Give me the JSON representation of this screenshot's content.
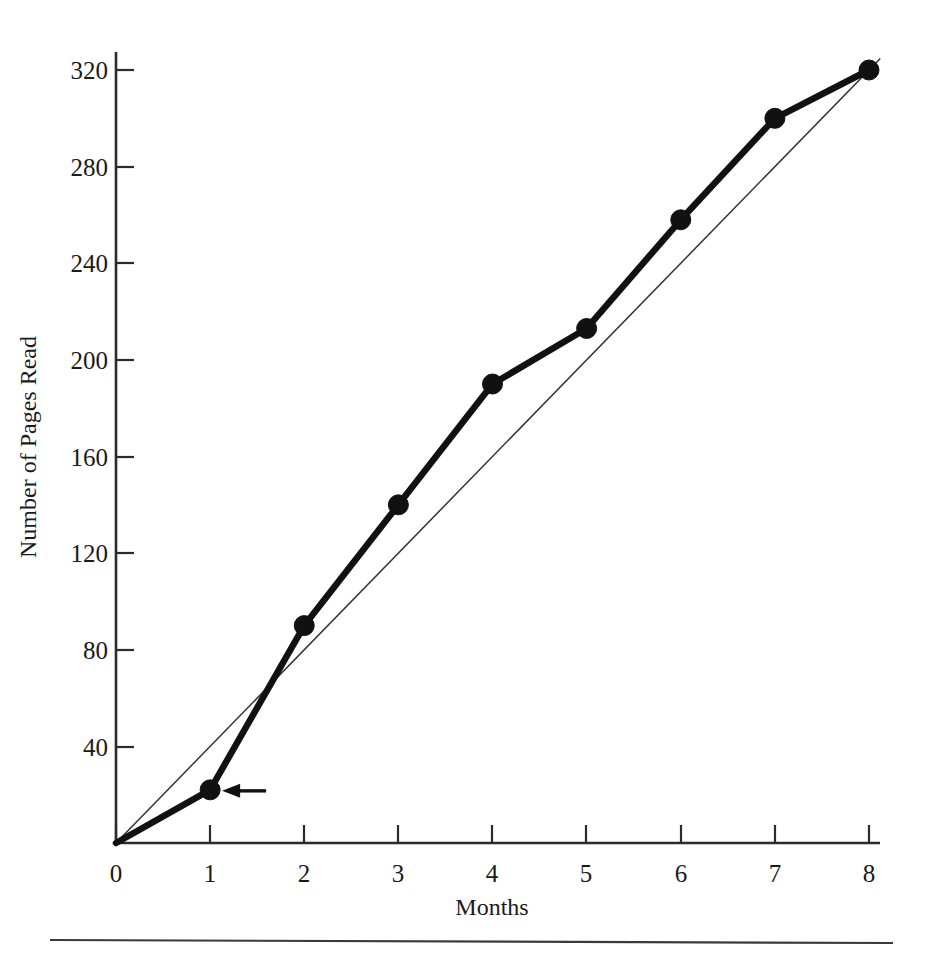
{
  "chart_data": {
    "type": "line",
    "title": "",
    "subtitle": "",
    "xlabel": "Months",
    "ylabel": "Number of Pages Read",
    "x": [
      0,
      1,
      2,
      3,
      4,
      5,
      6,
      7,
      8
    ],
    "xticklabels": [
      "0",
      "1",
      "2",
      "3",
      "4",
      "5",
      "6",
      "7",
      "8"
    ],
    "yticks": [
      40,
      80,
      120,
      160,
      200,
      240,
      280,
      320
    ],
    "yticklabels": [
      "40",
      "80",
      "120",
      "160",
      "200",
      "240",
      "280",
      "320"
    ],
    "xlim": [
      0,
      8
    ],
    "ylim": [
      0,
      330
    ],
    "grid": false,
    "legend": "none",
    "series": [
      {
        "name": "Pages read (actual)",
        "style": "thick-line-with-markers",
        "color": "#111111",
        "values": [
          0,
          22,
          90,
          140,
          190,
          213,
          258,
          300,
          320
        ]
      },
      {
        "name": "Constant-rate reference",
        "style": "thin-straight-line",
        "color": "#333333",
        "values": [
          0,
          40,
          80,
          120,
          160,
          200,
          240,
          280,
          320
        ]
      }
    ],
    "annotations": [
      {
        "name": "arrow-to-month-1-point",
        "type": "arrow",
        "points_to_x": 1,
        "points_to_y": 22,
        "direction": "left",
        "text": ""
      }
    ]
  },
  "figure": {
    "footer_rule": true
  }
}
